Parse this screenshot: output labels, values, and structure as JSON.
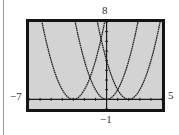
{
  "window": {
    "xmin": "−7",
    "xmax": "5",
    "ymin": "−1",
    "ymax": "8"
  },
  "colors": {
    "screen_bg": "#d3d3d3",
    "frame": "#141414",
    "curve": "#1a1a1a",
    "axis": "#1a1a1a"
  },
  "chart_data": {
    "type": "line",
    "title": "",
    "xlabel": "",
    "ylabel": "",
    "xlim": [
      -7,
      5
    ],
    "ylim": [
      -1,
      8
    ],
    "xscale": 1,
    "yscale": 1,
    "grid": false,
    "legend": null,
    "annotations": [
      "−7",
      "5",
      "−1",
      "8"
    ],
    "series": [
      {
        "name": "y = (x + 3)^2",
        "vertex": [
          -3,
          0
        ],
        "equation": "y=(x+3)^2",
        "style": "dotted"
      },
      {
        "name": "y = x^2",
        "vertex": [
          0,
          0
        ],
        "equation": "y=x^2",
        "style": "dotted"
      },
      {
        "name": "y = (x - 2)^2",
        "vertex": [
          2,
          0
        ],
        "equation": "y=(x-2)^2",
        "style": "dotted"
      }
    ]
  }
}
